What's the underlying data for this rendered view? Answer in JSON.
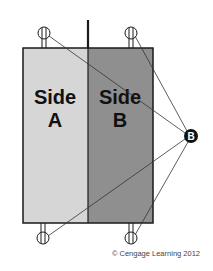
{
  "diagram": {
    "sides": [
      {
        "line1": "Side",
        "line2": "A",
        "fill": "#d6d6d6"
      },
      {
        "line1": "Side",
        "line2": "B",
        "fill": "#8f8f8f"
      }
    ],
    "terminal_label": "B",
    "credit": "© Cengage Learning 2012",
    "colors": {
      "outline": "#1a1a1a",
      "background": "#ffffff"
    }
  }
}
